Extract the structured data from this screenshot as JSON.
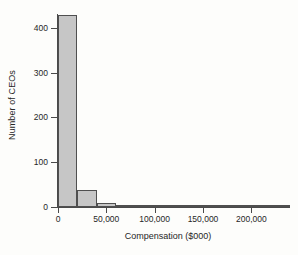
{
  "chart_data": {
    "type": "bar",
    "title": "",
    "subtitle": "",
    "xlabel": "Compensation ($000)",
    "ylabel": "Number of CEOs",
    "grid": false,
    "legend": null,
    "xlim": [
      0,
      240000
    ],
    "ylim": [
      0,
      440
    ],
    "bin_width": 20000,
    "xticks": [
      0,
      50000,
      100000,
      150000,
      200000
    ],
    "xtick_labels": [
      "0",
      "50,000",
      "100,000",
      "150,000",
      "200,000"
    ],
    "yticks": [
      0,
      100,
      200,
      300,
      400
    ],
    "ytick_labels": [
      "0",
      "100",
      "200",
      "300",
      "400"
    ],
    "bin_starts": [
      0,
      20000,
      40000,
      60000,
      80000,
      100000,
      120000,
      140000,
      160000,
      180000,
      200000,
      220000
    ],
    "categories": [
      "0–20,000",
      "20,000–40,000",
      "40,000–60,000",
      "60,000–80,000",
      "80,000–100,000",
      "100,000–120,000",
      "120,000–140,000",
      "140,000–160,000",
      "160,000–180,000",
      "180,000–200,000",
      "200,000–220,000",
      "220,000–240,000"
    ],
    "values": [
      429,
      38,
      9,
      3,
      2,
      0,
      1,
      1,
      0,
      0,
      0,
      2
    ],
    "bar_fill_color": "#c6c6c6",
    "bar_edge_color": "#4f4f4f",
    "axis_color": "#4a4a4a",
    "background_color": "#fdfdfb"
  }
}
